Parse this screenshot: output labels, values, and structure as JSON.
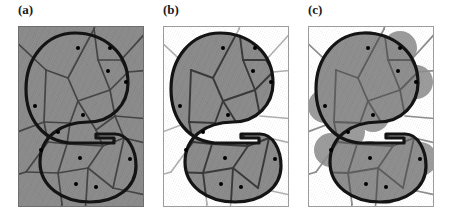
{
  "figure": {
    "caption_present": false,
    "background_color": "#ffffff",
    "panel_count": 3
  },
  "panels": [
    {
      "label": "(a)",
      "id": "panel-a",
      "description": "Voronoi diagram of sample points with full plane tessellated; entire frame shaded gray; target S-shaped region outlined in heavy black",
      "frame_fill": "#8c8c8c",
      "cell_fill": "#8c8c8c",
      "outside_fill": "#8c8c8c",
      "cell_edge_color": "#3a3a3a",
      "outline_color": "#111111",
      "disks_visible": false
    },
    {
      "label": "(b)",
      "id": "panel-b",
      "description": "Only Voronoi cells whose sites lie inside the shape are shaded gray; exterior cells are white with light gray edges",
      "frame_fill": "#ffffff",
      "cell_fill": "#8c8c8c",
      "outside_fill": "#ffffff",
      "cell_edge_color": "#3a3a3a",
      "outline_color": "#111111",
      "disks_visible": false
    },
    {
      "label": "(c)",
      "id": "panel-c",
      "description": "Gray disks of equal radius centered on each sample site union with the shaded Voronoi cells, producing a blobby cover of the shape",
      "frame_fill": "#ffffff",
      "cell_fill": "#8c8c8c",
      "outside_fill": "#ffffff",
      "cell_edge_color": "#6a6a6a",
      "outline_color": "#111111",
      "disks_visible": true,
      "disk_radius": 16,
      "disk_fill": "#9a9a9a"
    }
  ],
  "colors": {
    "gray_fill": "#8c8c8c",
    "dark_edge": "#3a3a3a",
    "light_edge": "#9e9e9e",
    "outline_black": "#111111",
    "point_black": "#000000",
    "frame_border": "#8f8f8f",
    "disk_gray": "#9a9a9a",
    "label_text": "#1a1a1a"
  },
  "geometry": {
    "panel_canvas": {
      "width": 126,
      "height": 181
    },
    "site_points": [
      {
        "id": "p1",
        "x": 60,
        "y": 22,
        "inside": true
      },
      {
        "id": "p2",
        "x": 92,
        "y": 22,
        "inside": true
      },
      {
        "id": "p3",
        "x": 90,
        "y": 45,
        "inside": true
      },
      {
        "id": "p4",
        "x": 108,
        "y": 56,
        "inside": true
      },
      {
        "id": "p5",
        "x": 17,
        "y": 80,
        "inside": true
      },
      {
        "id": "p6",
        "x": 65,
        "y": 89,
        "inside": true
      },
      {
        "id": "p7",
        "x": 40,
        "y": 106,
        "inside": true
      },
      {
        "id": "p8",
        "x": 23,
        "y": 124,
        "inside": true
      },
      {
        "id": "p9",
        "x": 62,
        "y": 132,
        "inside": true
      },
      {
        "id": "p10",
        "x": 112,
        "y": 133,
        "inside": true
      },
      {
        "id": "p11",
        "x": 58,
        "y": 158,
        "inside": true
      },
      {
        "id": "p12",
        "x": 78,
        "y": 161,
        "inside": true
      }
    ],
    "shape_name": "kidney-s-region",
    "outline_stroke_width": 3.2
  },
  "text": {
    "labels": [
      "(a)",
      "(b)",
      "(c)"
    ]
  }
}
